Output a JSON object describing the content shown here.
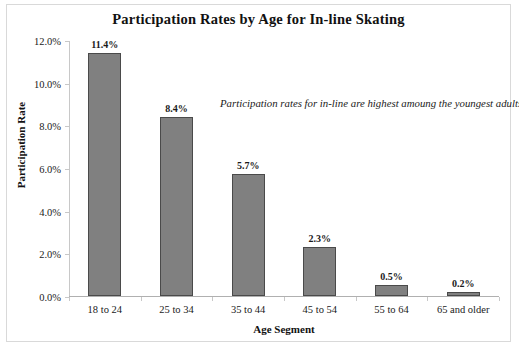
{
  "chart_data": {
    "type": "bar",
    "title": "Participation Rates by Age for In-line Skating",
    "xlabel": "Age Segment",
    "ylabel": "Participation Rate",
    "categories": [
      "18 to 24",
      "25 to 34",
      "35 to 44",
      "45 to 54",
      "55 to 64",
      "65 and older"
    ],
    "values": [
      11.4,
      8.4,
      5.7,
      2.3,
      0.5,
      0.2
    ],
    "value_labels": [
      "11.4%",
      "8.4%",
      "5.7%",
      "2.3%",
      "0.5%",
      "0.2%"
    ],
    "ylim": [
      0,
      12
    ],
    "ytick_values": [
      0,
      2,
      4,
      6,
      8,
      10,
      12
    ],
    "ytick_labels": [
      "0.0%",
      "2.0%",
      "4.0%",
      "6.0%",
      "8.0%",
      "10.0%",
      "12.0%"
    ],
    "grid": false,
    "legend": "none",
    "annotations": [
      {
        "text": "Participation rates for in-line are highest amoung the youngest adults.",
        "style": "italic"
      }
    ],
    "bar_color": "#808080",
    "bar_border_color": "#4a4a4a",
    "plot_background": "#ffffff",
    "frame_border_color": "#d9d9d9",
    "axis_color": "#b0b0b0",
    "text_color": "#1a1a1a"
  }
}
